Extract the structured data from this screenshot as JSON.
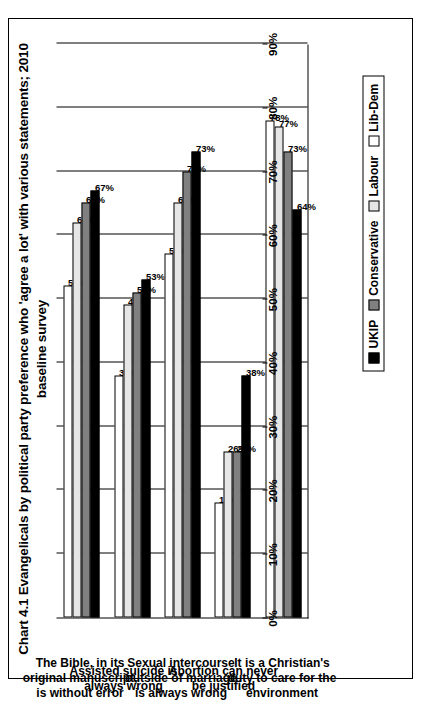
{
  "chart_data": {
    "type": "bar",
    "orientation": "horizontal",
    "title": "Chart 4.1 Evangelicals by political party preference who 'agree a lot' with various statements; 2010 baseline survey",
    "xlabel": "",
    "ylabel": "",
    "ylim": [
      0,
      90
    ],
    "tick_step": 10,
    "grid": true,
    "legend_position": "bottom-right",
    "tick_labels": [
      "0%",
      "10%",
      "20%",
      "30%",
      "40%",
      "50%",
      "60%",
      "70%",
      "80%",
      "90%"
    ],
    "categories": [
      "The Bible, in its original manuscript, is without error",
      "Assisted suicide is always wrong",
      "Sexual intercourse outside of marriage is always wrong",
      "Abortion can never be justified",
      "It is a Christian's duty to care for the environment"
    ],
    "series": [
      {
        "name": "UKIP",
        "color": "#000000",
        "values": [
          67,
          53,
          73,
          38,
          64
        ],
        "labels": [
          "67%",
          "53%",
          "73%",
          "38%",
          "64%"
        ]
      },
      {
        "name": "Conservative",
        "color": "#808080",
        "values": [
          65,
          51,
          70,
          26,
          73
        ],
        "labels": [
          "65%",
          "51%",
          "70%",
          "26%",
          "73%"
        ]
      },
      {
        "name": "Labour",
        "color": "#e6e6e6",
        "values": [
          62,
          49,
          65,
          26,
          77
        ],
        "labels": [
          "62%",
          "49%",
          "65%",
          "26%",
          "77%"
        ]
      },
      {
        "name": "Lib-Dem",
        "color": "#ffffff",
        "values": [
          52,
          38,
          57,
          18,
          78
        ],
        "labels": [
          "52%",
          "38%",
          "57%",
          "18%",
          "78%"
        ]
      }
    ]
  },
  "legend": {
    "items": [
      {
        "label": "UKIP",
        "key": "ukip"
      },
      {
        "label": "Conservative",
        "key": "conservative"
      },
      {
        "label": "Labour",
        "key": "labour"
      },
      {
        "label": "Lib-Dem",
        "key": "libdem"
      }
    ]
  }
}
